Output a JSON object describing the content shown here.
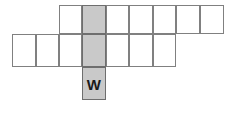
{
  "figure": {
    "type": "polyomino-net",
    "background_color": "#ffffff",
    "cell_fill_color": "#ffffff",
    "cell_stroke_color": "#808080",
    "shaded_fill_color": "#c9c9c9",
    "shaded_stroke_color": "#6e6e6e",
    "label_color": "#1a1a1a",
    "cell_size": 23.5,
    "origin": {
      "x": 12,
      "y": 5
    },
    "grid": {
      "columns": 9,
      "rows": 4,
      "column_x": [
        12,
        35.5,
        58.5,
        82,
        105.5,
        129,
        152.5,
        176,
        200,
        224
      ],
      "row_y": [
        5,
        34,
        67,
        100
      ]
    },
    "cells": [
      {
        "id": "r0c2",
        "name": "top-row-cell-1",
        "col": 2,
        "row": 0,
        "shaded": false,
        "label": ""
      },
      {
        "id": "r0c3",
        "name": "top-row-cell-2-shaded",
        "col": 3,
        "row": 0,
        "shaded": true,
        "label": ""
      },
      {
        "id": "r0c4",
        "name": "top-row-cell-3",
        "col": 4,
        "row": 0,
        "shaded": false,
        "label": ""
      },
      {
        "id": "r0c5",
        "name": "top-row-cell-4",
        "col": 5,
        "row": 0,
        "shaded": false,
        "label": ""
      },
      {
        "id": "r0c6",
        "name": "top-row-cell-5",
        "col": 6,
        "row": 0,
        "shaded": false,
        "label": ""
      },
      {
        "id": "r0c7",
        "name": "top-row-cell-6",
        "col": 7,
        "row": 0,
        "shaded": false,
        "label": ""
      },
      {
        "id": "r0c8",
        "name": "top-row-cell-7",
        "col": 8,
        "row": 0,
        "shaded": false,
        "label": ""
      },
      {
        "id": "r1c0",
        "name": "middle-row-cell-1",
        "col": 0,
        "row": 1,
        "shaded": false,
        "label": ""
      },
      {
        "id": "r1c1",
        "name": "middle-row-cell-2",
        "col": 1,
        "row": 1,
        "shaded": false,
        "label": ""
      },
      {
        "id": "r1c2",
        "name": "middle-row-cell-3",
        "col": 2,
        "row": 1,
        "shaded": false,
        "label": ""
      },
      {
        "id": "r1c3",
        "name": "middle-row-cell-4-shaded",
        "col": 3,
        "row": 1,
        "shaded": true,
        "label": ""
      },
      {
        "id": "r1c4",
        "name": "middle-row-cell-5",
        "col": 4,
        "row": 1,
        "shaded": false,
        "label": ""
      },
      {
        "id": "r1c5",
        "name": "middle-row-cell-6",
        "col": 5,
        "row": 1,
        "shaded": false,
        "label": ""
      },
      {
        "id": "r1c6",
        "name": "middle-row-cell-7",
        "col": 6,
        "row": 1,
        "shaded": false,
        "label": ""
      },
      {
        "id": "r2c3",
        "name": "bottom-row-cell-shaded-w",
        "col": 3,
        "row": 2,
        "shaded": true,
        "label": "W"
      }
    ],
    "labels": {
      "w": "W"
    }
  }
}
